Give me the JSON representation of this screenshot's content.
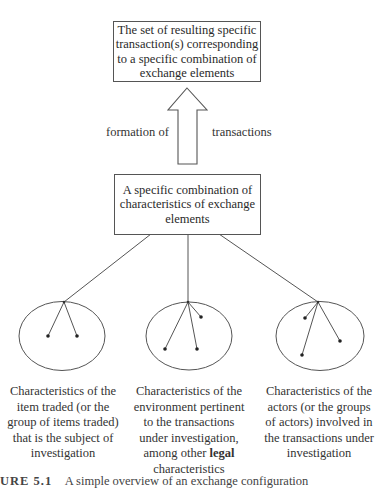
{
  "diagram": {
    "top_box": {
      "text": "The set of resulting specific transaction(s) corresponding to a specific combination of exchange elements"
    },
    "arrow": {
      "direction": "up",
      "label_left": "formation of",
      "label_right": "transactions"
    },
    "middle_box": {
      "text": "A specific combination of characteristics of exchange elements"
    },
    "groups": [
      {
        "id": "item",
        "dots": 2,
        "desc_lines": [
          "Characteristics of the",
          "item traded (or the",
          "group of items traded)",
          "that is the subject of",
          "investigation"
        ]
      },
      {
        "id": "environment",
        "dots": 3,
        "desc_lines": [
          "Characteristics of the",
          "environment pertinent",
          "to the transactions",
          "under investigation,",
          "among other "
        ],
        "desc_bold": "legal",
        "desc_tail": "characteristics"
      },
      {
        "id": "actors",
        "dots": 3,
        "desc_lines": [
          "Characteristics of the",
          "actors (or the groups",
          "of actors) involved in",
          "the transactions under",
          "investigation"
        ]
      }
    ],
    "caption": {
      "figure_label": "URE 5.1",
      "text": "A simple overview of an exchange configuration"
    }
  }
}
